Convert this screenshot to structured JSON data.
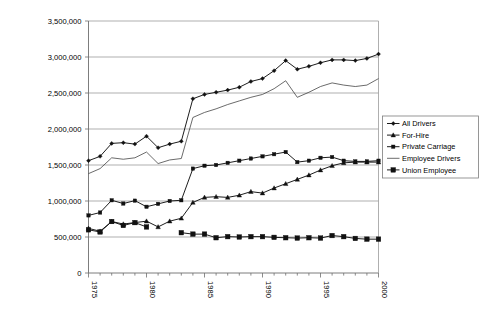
{
  "chart_data": {
    "type": "line",
    "title": "",
    "subtitle": "",
    "xlabel": "",
    "ylabel": "",
    "grid": true,
    "legend_position": "right",
    "xlim": [
      1975,
      2000
    ],
    "ylim": [
      0,
      3500000
    ],
    "x": [
      1975,
      1976,
      1977,
      1978,
      1979,
      1980,
      1981,
      1982,
      1983,
      1984,
      1985,
      1986,
      1987,
      1988,
      1989,
      1990,
      1991,
      1992,
      1993,
      1994,
      1995,
      1996,
      1997,
      1998,
      1999,
      2000
    ],
    "x_tick_labels": [
      "1975",
      "1980",
      "1985",
      "1990",
      "1995",
      "2000"
    ],
    "x_tick_values": [
      1975,
      1980,
      1985,
      1990,
      1995,
      2000
    ],
    "y_tick_labels": [
      "0",
      "500,000",
      "1,000,000",
      "1,500,000",
      "2,000,000",
      "2,500,000",
      "3,000,000",
      "3,500,000"
    ],
    "y_tick_values": [
      0,
      500000,
      1000000,
      1500000,
      2000000,
      2500000,
      3000000,
      3500000
    ],
    "series": [
      {
        "name": "All Drivers",
        "marker": "diamond",
        "values": [
          1560000,
          1620000,
          1800000,
          1810000,
          1790000,
          1900000,
          1740000,
          1790000,
          1830000,
          2420000,
          2480000,
          2510000,
          2540000,
          2580000,
          2660000,
          2700000,
          2810000,
          2950000,
          2830000,
          2870000,
          2920000,
          2960000,
          2960000,
          2950000,
          2980000,
          3040000
        ]
      },
      {
        "name": "For-Hire",
        "marker": "triangle",
        "values": [
          620000,
          580000,
          715000,
          680000,
          700000,
          720000,
          640000,
          720000,
          760000,
          980000,
          1050000,
          1060000,
          1050000,
          1080000,
          1130000,
          1110000,
          1180000,
          1240000,
          1300000,
          1360000,
          1430000,
          1490000,
          1530000,
          1540000,
          1540000,
          1540000
        ]
      },
      {
        "name": "Private Carriage",
        "marker": "square",
        "values": [
          800000,
          840000,
          1010000,
          965000,
          1005000,
          920000,
          960000,
          1000000,
          1010000,
          1450000,
          1490000,
          1500000,
          1530000,
          1560000,
          1590000,
          1620000,
          1650000,
          1680000,
          1540000,
          1560000,
          1600000,
          1610000,
          1560000,
          1550000,
          1550000,
          1560000
        ]
      },
      {
        "name": "Employee Drivers",
        "marker": "none",
        "values": [
          1380000,
          1450000,
          1600000,
          1580000,
          1600000,
          1680000,
          1520000,
          1570000,
          1590000,
          2160000,
          2230000,
          2280000,
          2340000,
          2390000,
          2440000,
          2480000,
          2560000,
          2670000,
          2440000,
          2510000,
          2590000,
          2640000,
          2610000,
          2590000,
          2610000,
          2700000
        ]
      },
      {
        "name": "Union  Employee",
        "marker": "filled-square",
        "values": [
          600000,
          570000,
          715000,
          660000,
          700000,
          640000,
          null,
          null,
          560000,
          540000,
          540000,
          490000,
          505000,
          500000,
          505000,
          505000,
          495000,
          490000,
          485000,
          490000,
          485000,
          520000,
          505000,
          480000,
          470000,
          470000
        ]
      }
    ]
  },
  "legend": {
    "items": [
      {
        "label": "All Drivers"
      },
      {
        "label": "For-Hire"
      },
      {
        "label": "Private Carriage"
      },
      {
        "label": "Employee Drivers"
      },
      {
        "label": "Union  Employee"
      }
    ]
  },
  "colors": {
    "line": "#111111",
    "grid": "#8c8c8c",
    "axis": "#6e6e6e",
    "background": "#ffffff"
  }
}
